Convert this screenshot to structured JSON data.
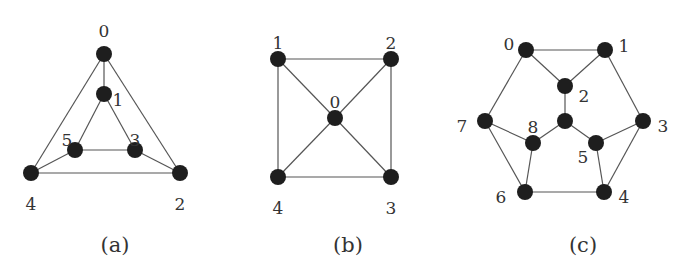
{
  "figure": {
    "graphs": [
      {
        "id": "a",
        "caption": "(a)",
        "caption_pos": [
          115,
          252
        ],
        "nodes": [
          {
            "id": "0",
            "label": "0",
            "x": 104,
            "y": 54,
            "lx": 104,
            "ly": 32
          },
          {
            "id": "1",
            "label": "1",
            "x": 104,
            "y": 94,
            "lx": 118,
            "ly": 101
          },
          {
            "id": "5",
            "label": "5",
            "x": 75,
            "y": 150,
            "lx": 67,
            "ly": 141
          },
          {
            "id": "3",
            "label": "3",
            "x": 135,
            "y": 150,
            "lx": 135,
            "ly": 141
          },
          {
            "id": "4",
            "label": "4",
            "x": 31,
            "y": 173,
            "lx": 31,
            "ly": 205
          },
          {
            "id": "2",
            "label": "2",
            "x": 180,
            "y": 173,
            "lx": 180,
            "ly": 205
          }
        ],
        "edges": [
          [
            "0",
            "1"
          ],
          [
            "0",
            "4"
          ],
          [
            "0",
            "2"
          ],
          [
            "4",
            "2"
          ],
          [
            "1",
            "5"
          ],
          [
            "1",
            "3"
          ],
          [
            "5",
            "3"
          ],
          [
            "5",
            "4"
          ],
          [
            "3",
            "2"
          ]
        ]
      },
      {
        "id": "b",
        "caption": "(b)",
        "caption_pos": [
          348,
          252
        ],
        "nodes": [
          {
            "id": "1",
            "label": "1",
            "x": 278,
            "y": 59,
            "lx": 278,
            "ly": 44
          },
          {
            "id": "2",
            "label": "2",
            "x": 391,
            "y": 59,
            "lx": 391,
            "ly": 44
          },
          {
            "id": "0",
            "label": "0",
            "x": 335,
            "y": 118,
            "lx": 335,
            "ly": 103
          },
          {
            "id": "4",
            "label": "4",
            "x": 278,
            "y": 177,
            "lx": 278,
            "ly": 209
          },
          {
            "id": "3",
            "label": "3",
            "x": 391,
            "y": 177,
            "lx": 391,
            "ly": 209
          }
        ],
        "edges": [
          [
            "1",
            "2"
          ],
          [
            "2",
            "3"
          ],
          [
            "3",
            "4"
          ],
          [
            "4",
            "1"
          ],
          [
            "0",
            "1"
          ],
          [
            "0",
            "2"
          ],
          [
            "0",
            "3"
          ],
          [
            "0",
            "4"
          ]
        ]
      },
      {
        "id": "c",
        "caption": "(c)",
        "caption_pos": [
          583,
          252
        ],
        "nodes": [
          {
            "id": "0",
            "label": "0",
            "x": 526,
            "y": 50,
            "lx": 509,
            "ly": 45
          },
          {
            "id": "1",
            "label": "1",
            "x": 605,
            "y": 50,
            "lx": 624,
            "ly": 47
          },
          {
            "id": "2",
            "label": "2",
            "x": 565,
            "y": 86,
            "lx": 584,
            "ly": 97
          },
          {
            "id": "c",
            "label": "",
            "x": 565,
            "y": 121,
            "lx": 565,
            "ly": 121
          },
          {
            "id": "7",
            "label": "7",
            "x": 485,
            "y": 121,
            "lx": 462,
            "ly": 127
          },
          {
            "id": "8",
            "label": "8",
            "x": 533,
            "y": 143,
            "lx": 533,
            "ly": 128
          },
          {
            "id": "5",
            "label": "5",
            "x": 596,
            "y": 143,
            "lx": 583,
            "ly": 158
          },
          {
            "id": "3",
            "label": "3",
            "x": 643,
            "y": 121,
            "lx": 663,
            "ly": 127
          },
          {
            "id": "6",
            "label": "6",
            "x": 525,
            "y": 192,
            "lx": 501,
            "ly": 198
          },
          {
            "id": "4",
            "label": "4",
            "x": 604,
            "y": 192,
            "lx": 624,
            "ly": 198
          }
        ],
        "edges": [
          [
            "0",
            "1"
          ],
          [
            "0",
            "2"
          ],
          [
            "1",
            "2"
          ],
          [
            "2",
            "c"
          ],
          [
            "c",
            "8"
          ],
          [
            "c",
            "5"
          ],
          [
            "0",
            "7"
          ],
          [
            "1",
            "3"
          ],
          [
            "7",
            "8"
          ],
          [
            "7",
            "6"
          ],
          [
            "8",
            "6"
          ],
          [
            "5",
            "3"
          ],
          [
            "5",
            "4"
          ],
          [
            "3",
            "4"
          ],
          [
            "6",
            "4"
          ]
        ]
      }
    ],
    "style": {
      "node_color": "#1e1e1e",
      "edge_color": "#555555",
      "text_color": "#333333",
      "node_radius": 8
    }
  }
}
